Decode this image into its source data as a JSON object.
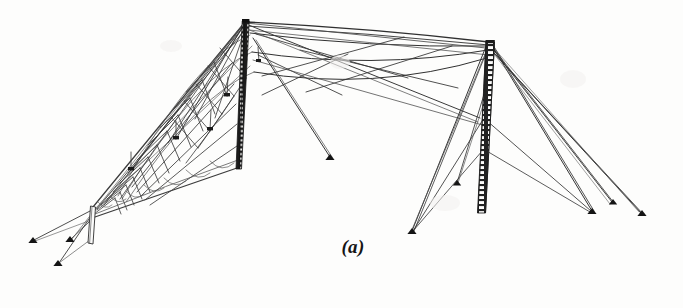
{
  "figure": {
    "label": "(a)",
    "kind": "engineering-line-drawing",
    "background_color": "#fdfdfc",
    "ink_color": "#1d1d1d",
    "cable_color": "#3a3a3a",
    "faint_cable_color": "#646464",
    "width": 683,
    "height": 308
  },
  "diagram_data": {
    "type": "line-drawing",
    "title": "(a)",
    "structures": [
      {
        "name": "left-lattice-mast",
        "style": "solid-dark-lattice",
        "top": [
          245,
          21
        ],
        "base": [
          238,
          168
        ],
        "width": 7,
        "lattice_rungs": 36
      },
      {
        "name": "right-lattice-mast",
        "style": "open-lattice",
        "top": [
          489,
          42
        ],
        "base": [
          481,
          212
        ],
        "width": 9,
        "lattice_rungs": 34
      },
      {
        "name": "left-end-post",
        "style": "thin-outline-post",
        "top": [
          93,
          207
        ],
        "base": [
          90,
          243
        ],
        "width": 5
      }
    ],
    "ground_anchors": [
      {
        "name": "anchor-far-left-upper",
        "x": 33,
        "y": 241
      },
      {
        "name": "anchor-far-left-lower",
        "x": 58,
        "y": 264
      },
      {
        "name": "anchor-left-mid",
        "x": 70,
        "y": 240
      },
      {
        "name": "anchor-center-isolated",
        "x": 330,
        "y": 158
      },
      {
        "name": "anchor-right-mast-left",
        "x": 412,
        "y": 232
      },
      {
        "name": "anchor-right-mast-left-short",
        "x": 457,
        "y": 184
      },
      {
        "name": "anchor-right-lower",
        "x": 592,
        "y": 212
      },
      {
        "name": "anchor-right-outer-upper",
        "x": 613,
        "y": 203
      },
      {
        "name": "anchor-right-outer-lower",
        "x": 642,
        "y": 214
      }
    ],
    "catenary_spans": [
      {
        "name": "top-span",
        "from": [
          245,
          21
        ],
        "to": [
          489,
          42
        ],
        "sag": 3
      },
      {
        "name": "upper-span",
        "from": [
          250,
          31
        ],
        "to": [
          489,
          44
        ],
        "sag": 10
      },
      {
        "name": "mid-span",
        "from": [
          252,
          52
        ],
        "to": [
          489,
          48
        ],
        "sag": 13
      },
      {
        "name": "lower-span",
        "from": [
          254,
          72
        ],
        "to": [
          487,
          55
        ],
        "sag": 12
      }
    ],
    "curtain_net": {
      "name": "left-wire-curtain",
      "apex": [
        245,
        21
      ],
      "lower_end": [
        93,
        207
      ],
      "mesh_bays": 14,
      "description": "triangular wire-mesh curtain with diamond cross bracing descending to the left end post"
    },
    "notes": "Scanned monochrome figure from a technical document; two guyed lattice masts supporting a sloping wire curtain, with guy cables radiating to ground anchors."
  }
}
